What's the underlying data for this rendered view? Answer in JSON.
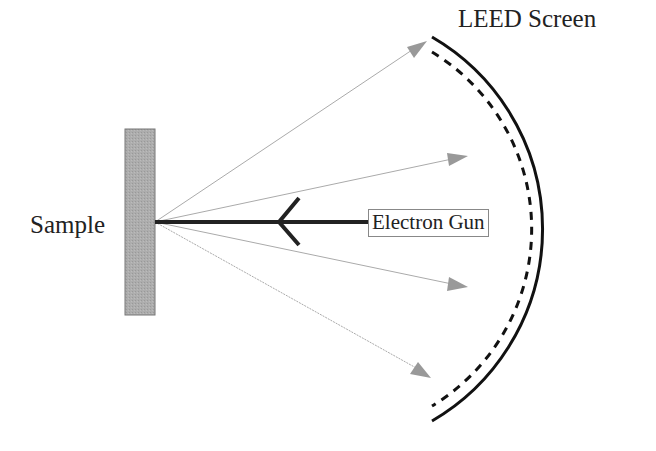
{
  "diagram": {
    "labels": {
      "sample": "Sample",
      "screen": "LEED Screen",
      "gun": "Electron Gun"
    },
    "elements": {
      "sample": {
        "shape": "rectangle",
        "fill": "#aaaaaa",
        "x": 125,
        "y": 129,
        "width": 30,
        "height": 186
      },
      "incident_beam": {
        "from": "electron-gun",
        "to": "sample",
        "color": "#222222"
      },
      "diffracted_beams": [
        {
          "tip": [
            427,
            41
          ]
        },
        {
          "tip": [
            468,
            156
          ]
        },
        {
          "tip": [
            468,
            287
          ]
        },
        {
          "tip": [
            431,
            378
          ]
        }
      ],
      "screen": {
        "outer": "solid arc",
        "inner": "dashed arc"
      }
    },
    "colors": {
      "beam": "#222222",
      "diffracted": "#999999",
      "arrowhead": "#999999",
      "sample_fill": "#aaaaaa",
      "screen": "#111111"
    }
  }
}
